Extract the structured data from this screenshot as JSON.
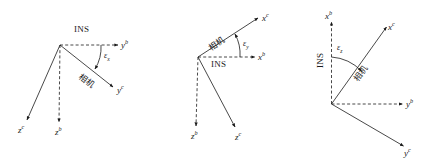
{
  "figure": {
    "background": "#ffffff",
    "stroke_color": "#1a1a1a",
    "panels": [
      {
        "id": "panel-x",
        "name": "epsilon-x-misalignment-diagram",
        "angle_label": "ε",
        "angle_subscript": "x",
        "ins_label": "INS",
        "camera_label": "相机",
        "axes": [
          {
            "id": "yb",
            "base": "y",
            "frame": "b",
            "style": "dashed",
            "direction": "right"
          },
          {
            "id": "zb",
            "base": "z",
            "frame": "b",
            "style": "dashed",
            "direction": "down"
          },
          {
            "id": "yc",
            "base": "y",
            "frame": "c",
            "style": "solid",
            "direction": "down-right"
          },
          {
            "id": "zc",
            "base": "z",
            "frame": "c",
            "style": "solid",
            "direction": "down-left"
          }
        ]
      },
      {
        "id": "panel-y",
        "name": "epsilon-y-misalignment-diagram",
        "angle_label": "ε",
        "angle_subscript": "y",
        "ins_label": "INS",
        "camera_label": "相机",
        "axes": [
          {
            "id": "xb",
            "base": "x",
            "frame": "b",
            "style": "dashed",
            "direction": "right"
          },
          {
            "id": "zb",
            "base": "z",
            "frame": "b",
            "style": "dashed",
            "direction": "down"
          },
          {
            "id": "xc",
            "base": "x",
            "frame": "c",
            "style": "solid",
            "direction": "up-right"
          },
          {
            "id": "zc",
            "base": "z",
            "frame": "c",
            "style": "solid",
            "direction": "down-right"
          }
        ]
      },
      {
        "id": "panel-z",
        "name": "epsilon-z-misalignment-diagram",
        "angle_label": "ε",
        "angle_subscript": "z",
        "ins_label": "INS",
        "camera_label": "相机",
        "axes": [
          {
            "id": "xb",
            "base": "x",
            "frame": "b",
            "style": "dashed",
            "direction": "up"
          },
          {
            "id": "yb",
            "base": "y",
            "frame": "b",
            "style": "dashed",
            "direction": "right"
          },
          {
            "id": "xc",
            "base": "x",
            "frame": "c",
            "style": "solid",
            "direction": "up-right"
          },
          {
            "id": "yc",
            "base": "y",
            "frame": "c",
            "style": "solid",
            "direction": "down-right"
          }
        ]
      }
    ]
  }
}
